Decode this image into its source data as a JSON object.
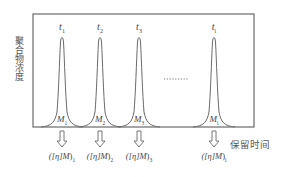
{
  "diagram": {
    "y_axis_label": "聚合物浓度",
    "x_axis_label": "保留时间",
    "frame": {
      "x": 33,
      "y": 14,
      "width": 221,
      "height": 113
    },
    "stroke_color": "#6a6a6a",
    "ellipsis": "........",
    "peaks": [
      {
        "id": "1",
        "time_label": "t",
        "time_sub": "1",
        "mass_label": "M",
        "mass_sub": "1",
        "result_prefix": "([η]",
        "result_mid": "M",
        "result_suffix": ")",
        "result_sub": "1",
        "cx": 62
      },
      {
        "id": "2",
        "time_label": "t",
        "time_sub": "2",
        "mass_label": "M",
        "mass_sub": "2",
        "result_prefix": "([η]",
        "result_mid": "M",
        "result_suffix": ")",
        "result_sub": "2",
        "cx": 100
      },
      {
        "id": "3",
        "time_label": "t",
        "time_sub": "3",
        "mass_label": "M",
        "mass_sub": "3",
        "result_prefix": "([η]",
        "result_mid": "M",
        "result_suffix": ")",
        "result_sub": "3",
        "cx": 139
      },
      {
        "id": "i",
        "time_label": "t",
        "time_sub": "i",
        "mass_label": "M",
        "mass_sub": "i",
        "result_prefix": "([η]",
        "result_mid": "M",
        "result_suffix": ")",
        "result_sub": "i",
        "cx": 214
      }
    ]
  }
}
